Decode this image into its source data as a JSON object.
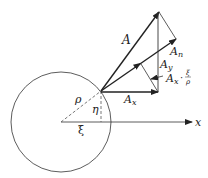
{
  "diagram": {
    "labels": {
      "vector_A": "A",
      "vector_An": "A",
      "vector_An_sub": "n",
      "vector_Ay": "A",
      "vector_Ay_sub": "y",
      "vector_Ax": "A",
      "vector_Ax_sub": "x",
      "projection": "A",
      "projection_sub": "x",
      "projection_dot": "·",
      "fraction_num": "ξ",
      "fraction_den": "ρ",
      "rho": "ρ",
      "eta": "η",
      "xi": "ξ",
      "axis_x": "x"
    },
    "colors": {
      "stroke": "#222222",
      "dashed": "#555555",
      "background": "#ffffff"
    }
  }
}
